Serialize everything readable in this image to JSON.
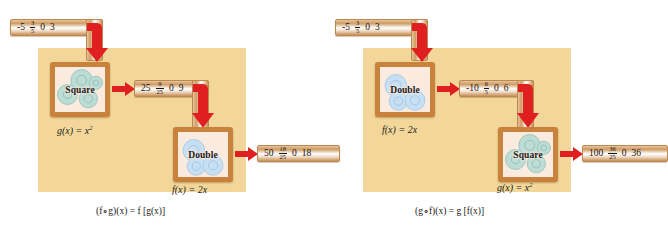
{
  "figure": {
    "colors": {
      "panel": "#f3d79a",
      "box_border": "#c8823c",
      "box_fill": "#fbeade",
      "arrow_red": "#e02020",
      "bar_tan": "#cf9c63",
      "gear_teal": "#a9d4cd",
      "gear_blue": "#b8d4ee"
    }
  },
  "left": {
    "name": "f-of-g-composition",
    "input_bar": {
      "values": [
        "-5",
        "3/5",
        "0",
        "3"
      ],
      "numerator": "3",
      "denominator": "5",
      "v1": "-5",
      "v3": "0",
      "v4": "3"
    },
    "machine1": {
      "label": "Square",
      "gear_color": "teal"
    },
    "middle_bar": {
      "v1": "25",
      "numerator": "9",
      "denominator": "25",
      "v3": "0",
      "v4": "9"
    },
    "machine2": {
      "label": "Double",
      "gear_color": "blue"
    },
    "output_bar": {
      "v1": "50",
      "numerator": "18",
      "denominator": "25",
      "v3": "0",
      "v4": "18"
    },
    "fn1_label": "g(x) = x",
    "fn1_exp": "2",
    "fn2_label": "f(x) = 2x",
    "caption_lhs": "(f∘g)(x) = f [g(x)]"
  },
  "right": {
    "name": "g-of-f-composition",
    "input_bar": {
      "values": [
        "-5",
        "3/5",
        "0",
        "3"
      ],
      "numerator": "3",
      "denominator": "5",
      "v1": "-5",
      "v3": "0",
      "v4": "3"
    },
    "machine1": {
      "label": "Double",
      "gear_color": "blue"
    },
    "middle_bar": {
      "v1": "-10",
      "numerator": "6",
      "denominator": "5",
      "v3": "0",
      "v4": "6"
    },
    "machine2": {
      "label": "Square",
      "gear_color": "teal"
    },
    "output_bar": {
      "v1": "100",
      "numerator": "36",
      "denominator": "25",
      "v3": "0",
      "v4": "36"
    },
    "fn1_label": "f(x) = 2x",
    "fn2_label": "g(x) = x",
    "fn2_exp": "2",
    "caption_lhs": "(g∘f)(x) = g [f(x)]"
  }
}
